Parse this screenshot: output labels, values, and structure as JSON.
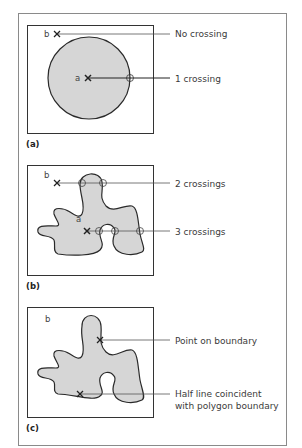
{
  "figure": {
    "panels": [
      {
        "id": "a",
        "caption": "(a)",
        "shape": "circle",
        "points": {
          "inside": "a",
          "outside": "b"
        },
        "annotations": [
          "No crossing",
          "1 crossing"
        ]
      },
      {
        "id": "b",
        "caption": "(b)",
        "shape": "irregular polygon",
        "points": {
          "inside": "a",
          "outside": "b"
        },
        "annotations": [
          "2 crossings",
          "3 crossings"
        ]
      },
      {
        "id": "c",
        "caption": "(c)",
        "shape": "irregular polygon",
        "points": {
          "outside": "b"
        },
        "annotations": [
          "Point on boundary",
          "Half line coincident",
          "with polygon boundary"
        ]
      }
    ],
    "colors": {
      "frame": "#8a8a8a",
      "box": "#333333",
      "fill": "#d6d6d6",
      "stroke": "#2a2a2a",
      "leader": "#555555"
    }
  }
}
